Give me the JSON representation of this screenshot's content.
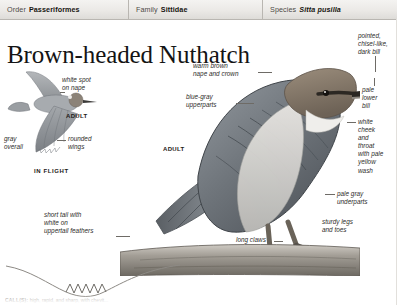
{
  "taxonomy": [
    {
      "key": "Order",
      "value": "Passeriformes",
      "italic": false
    },
    {
      "key": "Family",
      "value": "Sittidae",
      "italic": false
    },
    {
      "key": "Species",
      "value": "Sitta pusilla",
      "italic": true
    }
  ],
  "title": "Brown-headed Nuthatch",
  "plates": {
    "flight": {
      "caption": "IN FLIGHT",
      "age_label": "ADULT",
      "annotations": [
        "white spot\non nape",
        "gray\noverall",
        "rounded\nwings"
      ]
    },
    "perched": {
      "age_label": "ADULT",
      "annotations": [
        "warm brown\nnape and crown",
        "blue-gray\nupperparts",
        "pointed,\nchisel-like,\ndark bill",
        "pale\nlower\nbill",
        "white\ncheek\nand\nthroat\nwith pale\nyellow\nwash",
        "pale gray\nunderparts",
        "sturdy legs\nand toes",
        "long claws",
        "short tail with\nwhite on\nuppertail feathers"
      ]
    }
  },
  "sonogram": {
    "caption_key": "CALL(S):",
    "caption_text": "high, rapid, and sharp, with chevit..."
  },
  "colors": {
    "bar_top": "#f4f3f1",
    "bar_bottom": "#dedcd8",
    "bar_border": "#b9b6b1",
    "text": "#1a1a1a",
    "leader": "#6e6b66",
    "plumage_brown": "#8d7f6f",
    "plumage_gray": "#9aa0a6",
    "plumage_white": "#f2f1ee"
  }
}
